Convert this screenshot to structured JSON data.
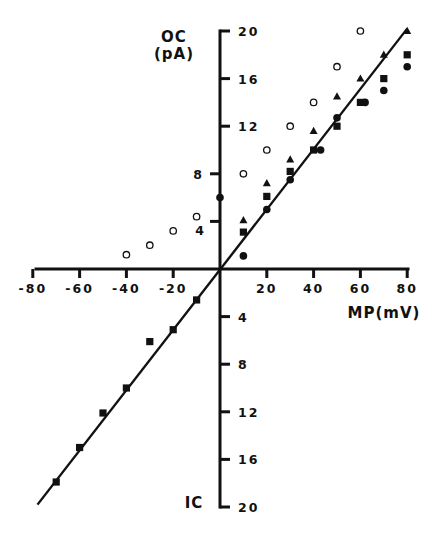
{
  "chart_data": {
    "type": "scatter",
    "title": "",
    "xlabel": "MP(mV)",
    "ylabel_upper": "OC (pA)",
    "ylabel_lower": "IC",
    "xlim": [
      -80,
      80
    ],
    "ylim": [
      -20,
      20
    ],
    "grid": false,
    "legend": "none",
    "x_ticks": [
      -80,
      -60,
      -40,
      -20,
      20,
      40,
      60,
      80
    ],
    "x_tick_labels": [
      "-80",
      "-60",
      "-40",
      "-20",
      "20",
      "40",
      "60",
      "80"
    ],
    "y_ticks_upper": [
      4,
      8,
      12,
      16,
      20
    ],
    "y_tick_labels_upper": [
      "4",
      "8",
      "12",
      "16",
      "20"
    ],
    "y_ticks_lower": [
      -4,
      -8,
      -12,
      -16,
      -20
    ],
    "y_tick_labels_lower": [
      "4",
      "8",
      "12",
      "16",
      "20"
    ],
    "fit_line": {
      "x": [
        -78,
        80
      ],
      "y": [
        -19.8,
        20.2
      ],
      "slope_pA_per_mV": 0.25
    },
    "series": [
      {
        "name": "open circles",
        "marker": "open-circle",
        "points": [
          [
            -40,
            1.2
          ],
          [
            -30,
            2.0
          ],
          [
            -20,
            3.2
          ],
          [
            -10,
            4.4
          ],
          [
            10,
            8.0
          ],
          [
            20,
            10.0
          ],
          [
            30,
            12.0
          ],
          [
            40,
            14.0
          ],
          [
            50,
            17.0
          ],
          [
            60,
            20.0
          ]
        ]
      },
      {
        "name": "filled triangles",
        "marker": "triangle",
        "points": [
          [
            10,
            4.1
          ],
          [
            20,
            7.2
          ],
          [
            30,
            9.2
          ],
          [
            40,
            11.6
          ],
          [
            50,
            14.5
          ],
          [
            60,
            16.0
          ],
          [
            70,
            18.0
          ],
          [
            80,
            20.0
          ]
        ]
      },
      {
        "name": "filled squares",
        "marker": "square",
        "points": [
          [
            -70,
            -17.9
          ],
          [
            -60,
            -15.0
          ],
          [
            -50,
            -12.1
          ],
          [
            -40,
            -10.0
          ],
          [
            -30,
            -6.1
          ],
          [
            -20,
            -5.1
          ],
          [
            -10,
            -2.6
          ],
          [
            10,
            3.1
          ],
          [
            20,
            6.1
          ],
          [
            30,
            8.2
          ],
          [
            40,
            10.0
          ],
          [
            50,
            12.0
          ],
          [
            60,
            14.0
          ],
          [
            70,
            16.0
          ],
          [
            80,
            18.0
          ]
        ]
      },
      {
        "name": "filled circles",
        "marker": "filled-circle",
        "points": [
          [
            0,
            6.0
          ],
          [
            10,
            1.1
          ],
          [
            20,
            5.0
          ],
          [
            30,
            7.5
          ],
          [
            43,
            10.0
          ],
          [
            50,
            12.7
          ],
          [
            62,
            14.0
          ],
          [
            70,
            15.0
          ],
          [
            80,
            17.0
          ]
        ]
      }
    ]
  },
  "labels": {
    "y_upper_title_line1": "OC",
    "y_upper_title_line2": "(pA)",
    "y_lower_title": "IC",
    "x_title": "MP(mV)"
  }
}
